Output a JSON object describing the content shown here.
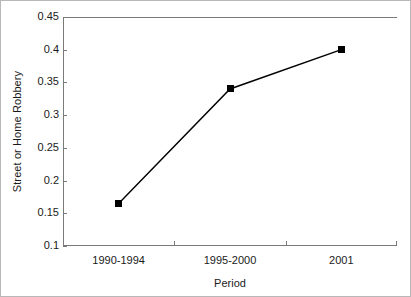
{
  "chart_data": {
    "type": "line",
    "title": "",
    "subtitle": "",
    "xlabel": "Period",
    "ylabel": "Street or Home Robbery",
    "categories": [
      "1990-1994",
      "1995-2000",
      "2001"
    ],
    "values": [
      0.165,
      0.34,
      0.4
    ],
    "series": [
      {
        "name": "Street or Home Robbery",
        "values": [
          0.165,
          0.34,
          0.4
        ]
      }
    ],
    "ylim": [
      0.1,
      0.45
    ],
    "ytick_labels": [
      "0.45",
      "0.4",
      "0.35",
      "0.3",
      "0.25",
      "0.2",
      "0.15",
      "0.1"
    ],
    "ytick_values": [
      0.45,
      0.4,
      0.35,
      0.3,
      0.25,
      0.2,
      0.15,
      0.1
    ],
    "grid": false,
    "legend": "none",
    "marker": "square",
    "line_color": "#000000",
    "marker_color": "#000000",
    "axis_color": "#7a7a7a",
    "background_color": "#ffffff"
  }
}
